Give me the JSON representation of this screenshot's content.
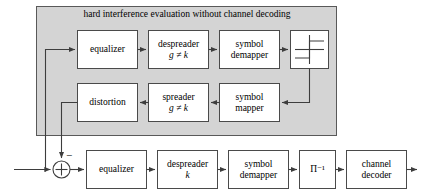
{
  "figure": {
    "type": "block-diagram",
    "title_panel": "hard interference evaluation without channel decoding",
    "panel_fill": "#d4d4d4",
    "panel_stroke": "#595959",
    "block_fill": "#ffffff",
    "block_stroke": "#4a4a4a",
    "line_color": "#3d3d3d",
    "background": "#ffffff"
  },
  "panel": {
    "label": "hard interference evaluation without channel decoding"
  },
  "blocks": {
    "top_equalizer": {
      "line1": "equalizer",
      "line2": ""
    },
    "top_despreader": {
      "line1": "despreader",
      "line2": "g ≠ k"
    },
    "top_symbol_demapper": {
      "line1": "symbol",
      "line2": "demapper"
    },
    "hard_decision": {
      "line1": "",
      "line2": "",
      "icon": "step-function-icon"
    },
    "distortion": {
      "line1": "distortion",
      "line2": ""
    },
    "spreader": {
      "line1": "spreader",
      "line2": "g ≠ k"
    },
    "symbol_mapper": {
      "line1": "symbol",
      "line2": "mapper"
    },
    "bot_equalizer": {
      "line1": "equalizer",
      "line2": ""
    },
    "bot_despreader": {
      "line1": "despreader",
      "line2": "k"
    },
    "bot_symbol_demapper": {
      "line1": "symbol",
      "line2": "demapper"
    },
    "deinterleaver": {
      "line1": "Π⁻¹",
      "line2": ""
    },
    "channel_decoder": {
      "line1": "channel",
      "line2": "decoder"
    }
  },
  "nodes": {
    "summing_junction": {
      "name": "summing-junction",
      "sign_top": "−",
      "sign_inner": "+"
    }
  },
  "signals": {
    "input_arrow": "input",
    "output_arrow": "output"
  }
}
